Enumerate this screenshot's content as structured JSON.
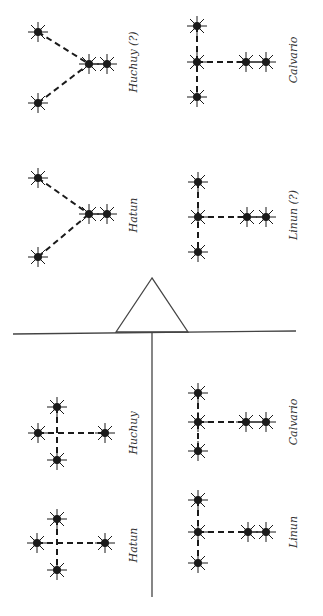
{
  "diagram": {
    "colors": {
      "ink": "#1a1a1a",
      "line": "#444444",
      "label": "#333333"
    },
    "fulcrum": {
      "apex": [
        152,
        278
      ],
      "base_left": [
        116,
        332
      ],
      "base_right": [
        188,
        332
      ]
    },
    "beam": {
      "x1": 13,
      "y1": 334,
      "x2": 296,
      "y2": 331
    },
    "divider": {
      "x1": 152,
      "y1": 333,
      "x2": 152,
      "y2": 597
    },
    "groups": [
      {
        "id": "huchuy-q-top",
        "label": "Huchuy (?)",
        "label_pos": [
          133,
          62
        ],
        "stars": [
          [
            38,
            32
          ],
          [
            38,
            103
          ],
          [
            89,
            64
          ],
          [
            107,
            64
          ]
        ],
        "dashes": [
          [
            [
              38,
              32
            ],
            [
              89,
              64
            ]
          ],
          [
            [
              38,
              103
            ],
            [
              89,
              64
            ]
          ]
        ],
        "solid": [
          [
            [
              89,
              64
            ],
            [
              107,
              64
            ]
          ]
        ]
      },
      {
        "id": "hatun-top",
        "label": "Hatun",
        "label_pos": [
          133,
          215
        ],
        "stars": [
          [
            38,
            178
          ],
          [
            38,
            257
          ],
          [
            89,
            214
          ],
          [
            107,
            214
          ]
        ],
        "dashes": [
          [
            [
              38,
              178
            ],
            [
              89,
              214
            ]
          ],
          [
            [
              38,
              257
            ],
            [
              89,
              214
            ]
          ]
        ],
        "solid": [
          [
            [
              89,
              214
            ],
            [
              107,
              214
            ]
          ]
        ]
      },
      {
        "id": "calvario-top",
        "label": "Calvario",
        "label_pos": [
          293,
          60
        ],
        "stars": [
          [
            197,
            26
          ],
          [
            197,
            62
          ],
          [
            197,
            97
          ],
          [
            246,
            62
          ],
          [
            266,
            62
          ]
        ],
        "dashes": [
          [
            [
              197,
              26
            ],
            [
              197,
              97
            ]
          ],
          [
            [
              197,
              62
            ],
            [
              246,
              62
            ]
          ]
        ],
        "solid": [
          [
            [
              246,
              62
            ],
            [
              266,
              62
            ]
          ]
        ]
      },
      {
        "id": "linun-q-top",
        "label": "Linun (?)",
        "label_pos": [
          293,
          215
        ],
        "stars": [
          [
            198,
            182
          ],
          [
            198,
            217
          ],
          [
            198,
            252
          ],
          [
            247,
            217
          ],
          [
            266,
            217
          ]
        ],
        "dashes": [
          [
            [
              198,
              182
            ],
            [
              198,
              252
            ]
          ],
          [
            [
              198,
              217
            ],
            [
              247,
              217
            ]
          ]
        ],
        "solid": [
          [
            [
              247,
              217
            ],
            [
              266,
              217
            ]
          ]
        ]
      },
      {
        "id": "huchuy-bottom",
        "label": "Huchuy",
        "label_pos": [
          133,
          433
        ],
        "stars": [
          [
            57,
            407
          ],
          [
            38,
            433
          ],
          [
            57,
            460
          ],
          [
            105,
            433
          ]
        ],
        "dashes": [
          [
            [
              57,
              407
            ],
            [
              57,
              460
            ]
          ],
          [
            [
              38,
              433
            ],
            [
              105,
              433
            ]
          ]
        ],
        "solid": []
      },
      {
        "id": "hatun-bottom",
        "label": "Hatun",
        "label_pos": [
          133,
          545
        ],
        "stars": [
          [
            57,
            519
          ],
          [
            37,
            543
          ],
          [
            57,
            570
          ],
          [
            105,
            543
          ]
        ],
        "dashes": [
          [
            [
              57,
              519
            ],
            [
              57,
              570
            ]
          ],
          [
            [
              37,
              543
            ],
            [
              105,
              543
            ]
          ]
        ],
        "solid": []
      },
      {
        "id": "calvario-bottom",
        "label": "Calvario",
        "label_pos": [
          293,
          422
        ],
        "stars": [
          [
            198,
            393
          ],
          [
            198,
            422
          ],
          [
            198,
            451
          ],
          [
            246,
            422
          ],
          [
            266,
            422
          ]
        ],
        "dashes": [
          [
            [
              198,
              393
            ],
            [
              198,
              451
            ]
          ],
          [
            [
              198,
              422
            ],
            [
              246,
              422
            ]
          ]
        ],
        "solid": [
          [
            [
              246,
              422
            ],
            [
              266,
              422
            ]
          ]
        ]
      },
      {
        "id": "linun-bottom",
        "label": "Linun",
        "label_pos": [
          293,
          532
        ],
        "stars": [
          [
            198,
            500
          ],
          [
            198,
            532
          ],
          [
            198,
            563
          ],
          [
            248,
            532
          ],
          [
            266,
            532
          ]
        ],
        "dashes": [
          [
            [
              198,
              500
            ],
            [
              198,
              563
            ]
          ],
          [
            [
              198,
              532
            ],
            [
              248,
              532
            ]
          ]
        ],
        "solid": [
          [
            [
              248,
              532
            ],
            [
              266,
              532
            ]
          ]
        ]
      }
    ]
  },
  "labels": {
    "huchuy_q_top": "Huchuy (?)",
    "hatun_top": "Hatun",
    "calvario_top": "Calvario",
    "linun_q_top": "Linun (?)",
    "huchuy_bottom": "Huchuy",
    "hatun_bottom": "Hatun",
    "calvario_bottom": "Calvario",
    "linun_bottom": "Linun"
  }
}
